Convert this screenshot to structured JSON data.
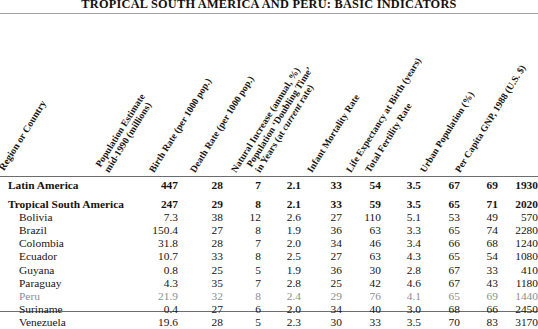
{
  "title": "TROPICAL SOUTH AMERICA AND PERU: BASIC INDICATORS",
  "stub_header": "Region or Country",
  "colors": {
    "text": "#17130f",
    "muted_row": "#8e8e8e",
    "rule": "#6d6d6d"
  },
  "column_headers": [
    "Population Estimate mid-1990 (millions)",
    "Birth Rate (per 1000 pop.)",
    "Death Rate (per 1000 pop.)",
    "Natural Increase (annual, %)",
    "Population 'Doubling Time' in Years (at current rate)",
    "Infant Mortality Rate",
    "Life Expectancy at Birth (years)",
    "Total Fertility Rate",
    "Urban Population (%)",
    "Per Capita GNP, 1988 (U.S. $)"
  ],
  "chart_data": {
    "type": "table",
    "title": "TROPICAL SOUTH AMERICA AND PERU: BASIC INDICATORS",
    "columns": [
      "Region or Country",
      "Population Estimate mid-1990 (millions)",
      "Birth Rate (per 1000 pop.)",
      "Death Rate (per 1000 pop.)",
      "Natural Increase (annual, %)",
      "Population 'Doubling Time' in Years (at current rate)",
      "Infant Mortality Rate",
      "Life Expectancy at Birth (years)",
      "Total Fertility Rate",
      "Urban Population (%)",
      "Per Capita GNP, 1988 (U.S. $)"
    ],
    "rows": [
      {
        "name": "Latin America",
        "style": "bold",
        "values": [
          "447",
          "28",
          "7",
          "2.1",
          "33",
          "54",
          "3.5",
          "67",
          "69",
          "1930"
        ]
      },
      {
        "name": "Tropical South America",
        "style": "bold",
        "values": [
          "247",
          "29",
          "8",
          "2.1",
          "33",
          "59",
          "3.5",
          "65",
          "71",
          "2020"
        ]
      },
      {
        "name": "Bolivia",
        "style": "indent",
        "values": [
          "7.3",
          "38",
          "12",
          "2.6",
          "27",
          "110",
          "5.1",
          "53",
          "49",
          "570"
        ]
      },
      {
        "name": "Brazil",
        "style": "indent",
        "values": [
          "150.4",
          "27",
          "8",
          "1.9",
          "36",
          "63",
          "3.3",
          "65",
          "74",
          "2280"
        ]
      },
      {
        "name": "Colombia",
        "style": "indent",
        "values": [
          "31.8",
          "28",
          "7",
          "2.0",
          "34",
          "46",
          "3.4",
          "66",
          "68",
          "1240"
        ]
      },
      {
        "name": "Ecuador",
        "style": "indent",
        "values": [
          "10.7",
          "33",
          "8",
          "2.5",
          "27",
          "63",
          "4.3",
          "65",
          "54",
          "1080"
        ]
      },
      {
        "name": "Guyana",
        "style": "indent",
        "values": [
          "0.8",
          "25",
          "5",
          "1.9",
          "36",
          "30",
          "2.8",
          "67",
          "33",
          "410"
        ]
      },
      {
        "name": "Paraguay",
        "style": "indent",
        "values": [
          "4.3",
          "35",
          "7",
          "2.8",
          "25",
          "42",
          "4.6",
          "67",
          "43",
          "1180"
        ]
      },
      {
        "name": "Peru",
        "style": "indent muted",
        "values": [
          "21.9",
          "32",
          "8",
          "2.4",
          "29",
          "76",
          "4.1",
          "65",
          "69",
          "1440"
        ]
      },
      {
        "name": "Suriname",
        "style": "indent",
        "values": [
          "0.4",
          "27",
          "6",
          "2.0",
          "34",
          "40",
          "3.0",
          "68",
          "66",
          "2450"
        ]
      },
      {
        "name": "Venezuela",
        "style": "indent",
        "values": [
          "19.6",
          "28",
          "5",
          "2.3",
          "30",
          "33",
          "3.5",
          "70",
          "83",
          "3170"
        ]
      }
    ]
  }
}
